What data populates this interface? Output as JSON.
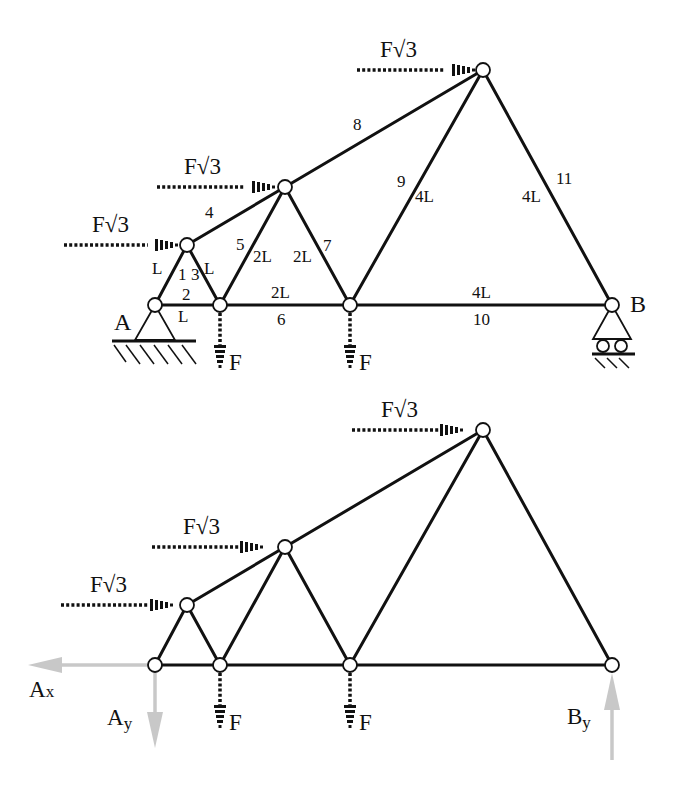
{
  "top_diagram": {
    "supports": {
      "A": "A",
      "B": "B"
    },
    "members": [
      {
        "id": "1",
        "length": "L"
      },
      {
        "id": "2",
        "length": "L"
      },
      {
        "id": "3",
        "length": "L"
      },
      {
        "id": "4",
        "length": ""
      },
      {
        "id": "5",
        "length": "2L"
      },
      {
        "id": "6",
        "length": "2L"
      },
      {
        "id": "7",
        "length": "2L"
      },
      {
        "id": "8",
        "length": ""
      },
      {
        "id": "9",
        "length": "4L"
      },
      {
        "id": "10",
        "length": "4L"
      },
      {
        "id": "11",
        "length": "4L"
      }
    ],
    "loads": {
      "horizontal": [
        "F√3",
        "F√3",
        "F√3"
      ],
      "vertical": [
        "F",
        "F"
      ]
    }
  },
  "bottom_diagram": {
    "loads": {
      "horizontal": [
        "F√3",
        "F√3",
        "F√3"
      ],
      "vertical": [
        "F",
        "F"
      ]
    },
    "reactions": {
      "ax": "A",
      "ax_sub": "x",
      "ay": "A",
      "ay_sub": "y",
      "by": "B",
      "by_sub": "y"
    },
    "reaction_color": "#c8c8c8"
  }
}
